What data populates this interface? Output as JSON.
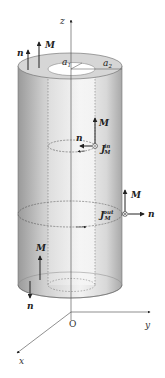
{
  "diagram": {
    "type": "hollow cylinder magnetization",
    "labels": {
      "z_axis": "z",
      "y_axis": "y",
      "x_axis": "x",
      "origin": "O",
      "inner_radius": "a",
      "inner_radius_sub": "1",
      "outer_radius": "a",
      "outer_radius_sub": "2",
      "magnetization": "M",
      "normal": "n",
      "inner_current": "J",
      "inner_current_sub": "M",
      "inner_current_sup": "in",
      "outer_current": "J",
      "outer_current_sub": "M",
      "outer_current_sup": "out"
    },
    "colors": {
      "cylinder_body": "#c8c8c8",
      "cylinder_top": "#d9d9d9",
      "inner_bore": "#ffffff",
      "lines": "#333333",
      "axes": "#555555"
    }
  }
}
